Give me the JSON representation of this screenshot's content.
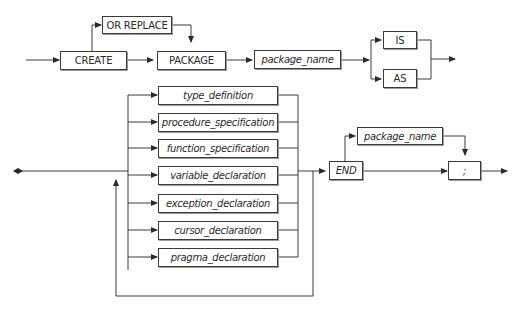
{
  "diagram": {
    "type": "syntax-railroad",
    "row1": {
      "create": "CREATE",
      "or_replace": "OR REPLACE",
      "package": "PACKAGE",
      "package_name": "package_name",
      "is": "IS",
      "as": "AS"
    },
    "row2": {
      "declarations": [
        {
          "label": "type_definition"
        },
        {
          "label": "procedure_specification"
        },
        {
          "label": "function_specification"
        },
        {
          "label": "variable_declaration"
        },
        {
          "label": "exception_declaration"
        },
        {
          "label": "cursor_declaration"
        },
        {
          "label": "pragma_declaration"
        }
      ],
      "end": "END",
      "package_name": "package_name",
      "semicolon": ";"
    },
    "colors": {
      "line": "#3a3a3a",
      "background": "#ffffff"
    }
  }
}
